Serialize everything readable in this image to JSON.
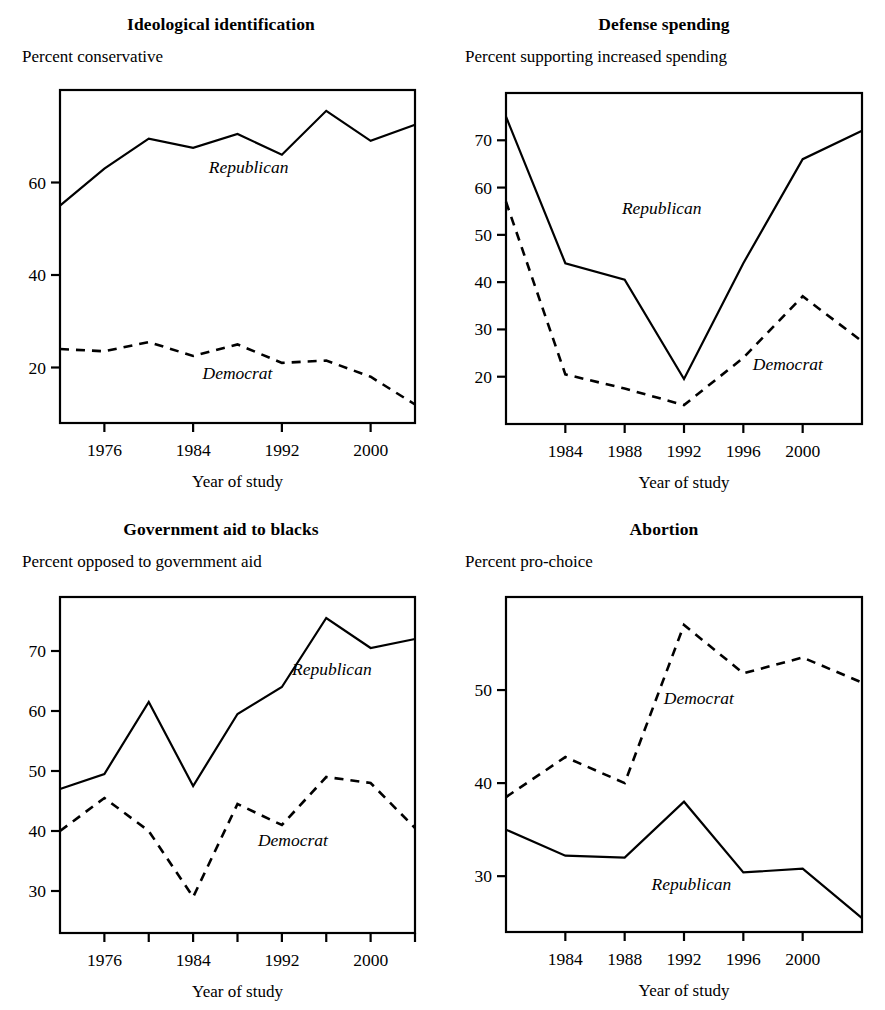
{
  "figure": {
    "panel_count": 4,
    "series_names": [
      "Republican",
      "Democrat"
    ],
    "x_axis_title": "Year of study"
  },
  "chart_data": [
    {
      "type": "line",
      "panel": "top-left",
      "title": "Ideological identification",
      "subtitle": "Percent conservative",
      "ylabel": "Percent conservative",
      "xlabel": "Year of study",
      "xlim": [
        1972,
        2004
      ],
      "ylim": [
        8,
        80
      ],
      "xticks": [
        1976,
        1984,
        1992,
        2000
      ],
      "xticklabels": [
        "1976",
        "1984",
        "1992",
        "2000"
      ],
      "yticks": [
        20,
        40,
        60
      ],
      "yticklabels": [
        "20",
        "40",
        "60"
      ],
      "grid": false,
      "legend": "inline-annotation",
      "x": [
        1972,
        1976,
        1980,
        1984,
        1988,
        1992,
        1996,
        2000,
        2004
      ],
      "series": [
        {
          "name": "Republican",
          "style": "solid",
          "values": [
            55.0,
            63.0,
            69.5,
            67.5,
            70.5,
            66.0,
            75.5,
            69.0,
            72.5
          ]
        },
        {
          "name": "Democrat",
          "style": "dashed",
          "values": [
            24.0,
            23.5,
            25.5,
            22.5,
            25.0,
            21.0,
            21.5,
            18.0,
            12.0
          ]
        }
      ]
    },
    {
      "type": "line",
      "panel": "top-right",
      "title": "Defense spending",
      "subtitle": "Percent supporting increased spending",
      "ylabel": "Percent supporting increased spending",
      "xlabel": "Year of study",
      "xlim": [
        1980,
        2004
      ],
      "ylim": [
        10,
        80
      ],
      "xticks": [
        1984,
        1988,
        1992,
        1996,
        2000
      ],
      "xticklabels": [
        "1984",
        "1988",
        "1992",
        "1996",
        "2000"
      ],
      "yticks": [
        20,
        30,
        40,
        50,
        60,
        70
      ],
      "yticklabels": [
        "20",
        "30",
        "40",
        "50",
        "60",
        "70"
      ],
      "grid": false,
      "legend": "inline-annotation",
      "x": [
        1980,
        1984,
        1988,
        1992,
        1996,
        2000,
        2004
      ],
      "series": [
        {
          "name": "Republican",
          "style": "solid",
          "values": [
            75.0,
            44.0,
            40.5,
            19.5,
            44.0,
            66.0,
            72.0
          ]
        },
        {
          "name": "Democrat",
          "style": "dashed",
          "values": [
            57.0,
            20.5,
            17.5,
            14.0,
            24.0,
            37.0,
            27.5
          ]
        }
      ]
    },
    {
      "type": "line",
      "panel": "bottom-left",
      "title": "Government aid to blacks",
      "subtitle": "Percent opposed to government aid",
      "ylabel": "Percent opposed to government aid",
      "xlabel": "Year of study",
      "xlim": [
        1972,
        2004
      ],
      "ylim": [
        23,
        79
      ],
      "xticks": [
        1976,
        1980,
        1984,
        1988,
        1992,
        1996,
        2000,
        2004
      ],
      "xticklabels": [
        "1976",
        "",
        "1984",
        "",
        "1992",
        "",
        "2000",
        ""
      ],
      "yticks": [
        30,
        40,
        50,
        60,
        70
      ],
      "yticklabels": [
        "30",
        "40",
        "50",
        "60",
        "70"
      ],
      "grid": false,
      "legend": "inline-annotation",
      "x": [
        1972,
        1976,
        1980,
        1984,
        1988,
        1992,
        1996,
        2000,
        2004
      ],
      "series": [
        {
          "name": "Republican",
          "style": "solid",
          "values": [
            47.0,
            49.5,
            61.5,
            47.5,
            59.5,
            64.0,
            75.5,
            70.5,
            72.0
          ]
        },
        {
          "name": "Democrat",
          "style": "dashed",
          "values": [
            40.0,
            45.5,
            40.0,
            29.0,
            44.5,
            41.0,
            49.0,
            48.0,
            40.5
          ]
        }
      ]
    },
    {
      "type": "line",
      "panel": "bottom-right",
      "title": "Abortion",
      "subtitle": "Percent pro-choice",
      "ylabel": "Percent pro-choice",
      "xlabel": "Year of study",
      "xlim": [
        1980,
        2004
      ],
      "ylim": [
        24,
        60
      ],
      "xticks": [
        1984,
        1988,
        1992,
        1996,
        2000
      ],
      "xticklabels": [
        "1984",
        "1988",
        "1992",
        "1996",
        "2000"
      ],
      "yticks": [
        30,
        40,
        50
      ],
      "yticklabels": [
        "30",
        "40",
        "50"
      ],
      "grid": false,
      "legend": "inline-annotation",
      "x": [
        1980,
        1984,
        1988,
        1992,
        1996,
        2000,
        2004
      ],
      "series": [
        {
          "name": "Republican",
          "style": "solid",
          "values": [
            35.0,
            32.2,
            32.0,
            38.0,
            30.4,
            30.8,
            25.5
          ]
        },
        {
          "name": "Democrat",
          "style": "dashed",
          "values": [
            38.5,
            42.8,
            40.0,
            57.0,
            51.8,
            53.5,
            50.8
          ]
        }
      ]
    }
  ],
  "annotations": {
    "p1_republican": {
      "label": "Republican",
      "x": 1989.0,
      "y": 62.0
    },
    "p1_democrat": {
      "label": "Democrat",
      "x": 1988.0,
      "y": 17.5
    },
    "p2_republican": {
      "label": "Republican",
      "x": 1990.5,
      "y": 54.5
    },
    "p2_democrat": {
      "label": "Democrat",
      "x": 1999.0,
      "y": 21.5
    },
    "p3_republican": {
      "label": "Republican",
      "x": 1996.5,
      "y": 66.0
    },
    "p3_democrat": {
      "label": "Democrat",
      "x": 1993.0,
      "y": 37.5
    },
    "p4_republican": {
      "label": "Republican",
      "x": 1992.5,
      "y": 28.5
    },
    "p4_democrat": {
      "label": "Democrat",
      "x": 1993.0,
      "y": 48.5
    }
  },
  "colors": {
    "line": "#000000",
    "axis": "#000000",
    "background": "#ffffff"
  }
}
